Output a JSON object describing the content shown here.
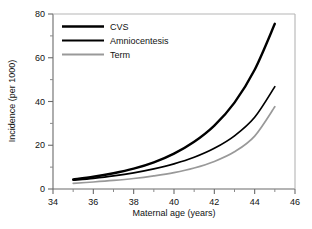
{
  "chart_data": {
    "type": "line",
    "title": "",
    "xlabel": "Maternal age (years)",
    "ylabel": "Incidence (per 1000)",
    "xlim": [
      34,
      46
    ],
    "ylim": [
      0,
      80
    ],
    "grid": false,
    "legend_position": "top-left",
    "x_ticks": [
      "34",
      "36",
      "38",
      "40",
      "42",
      "44",
      "46"
    ],
    "x_tick_values": [
      34,
      36,
      38,
      40,
      42,
      44,
      46
    ],
    "x_minor_ticks": [
      35,
      37,
      39,
      41,
      43,
      45
    ],
    "y_ticks": [
      "0",
      "20",
      "40",
      "60",
      "80"
    ],
    "y_tick_values": [
      0,
      20,
      40,
      60,
      80
    ],
    "y_minor_ticks": [
      10,
      30,
      50,
      70
    ],
    "x": [
      35,
      36,
      37,
      38,
      39,
      40,
      41,
      42,
      43,
      44,
      45
    ],
    "series": [
      {
        "name": "CVS",
        "color": "#000000",
        "width": 2.4,
        "values": [
          4.4,
          5.6,
          7.2,
          9.3,
          12.2,
          16.2,
          21.6,
          29.0,
          39.5,
          54.5,
          75.5
        ]
      },
      {
        "name": "Amniocentesis",
        "color": "#000000",
        "width": 1.7,
        "values": [
          4.0,
          4.9,
          6.0,
          7.4,
          9.2,
          11.5,
          14.5,
          18.6,
          24.3,
          32.8,
          46.8
        ]
      },
      {
        "name": "Term",
        "color": "#999999",
        "width": 1.7,
        "values": [
          2.6,
          3.2,
          3.9,
          4.8,
          6.0,
          7.5,
          9.6,
          12.6,
          17.0,
          24.2,
          37.6
        ]
      }
    ]
  },
  "legend": {
    "entries": [
      {
        "label": "CVS"
      },
      {
        "label": "Amniocentesis"
      },
      {
        "label": "Term"
      }
    ]
  },
  "axes": {
    "x_title": "Maternal age (years)",
    "y_title": "Incidence (per 1000)"
  },
  "colors": {
    "axis": "#6b6b6b",
    "text": "#111111",
    "cvs": "#000000",
    "amniocentesis": "#000000",
    "term": "#999999",
    "background": "#ffffff"
  }
}
